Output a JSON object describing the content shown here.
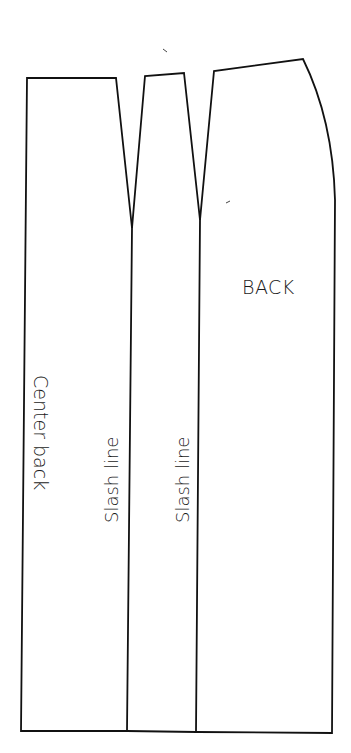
{
  "diagram": {
    "type": "skirt pattern (back), slashed for flare",
    "stroke_color": "#111111",
    "background": "#ffffff",
    "labels": {
      "piece_name": "BACK",
      "center_back": "Center back",
      "slash_line_1": "Slash line",
      "slash_line_2": "Slash line"
    },
    "sections": [
      {
        "name": "center-back-panel",
        "label": "Center back"
      },
      {
        "name": "middle-panel",
        "label": "Slash line"
      },
      {
        "name": "side-panel",
        "label": "BACK"
      }
    ],
    "darts": 2,
    "slash_lines": 2
  }
}
